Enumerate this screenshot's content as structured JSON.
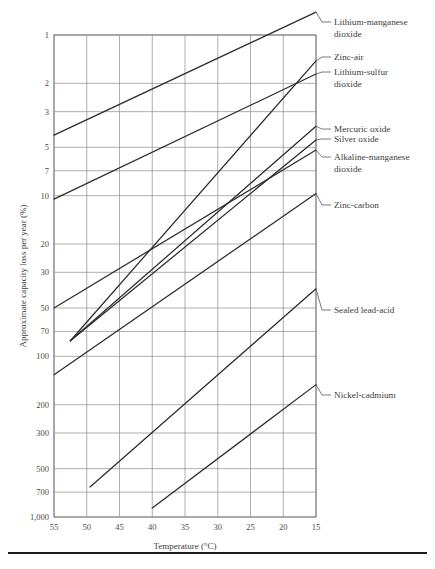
{
  "chart_data": {
    "type": "line",
    "title": "",
    "xlabel": "Temperature (°C)",
    "ylabel": "Approximate capacity loss per year (%)",
    "xticks": [
      55,
      50,
      45,
      40,
      35,
      30,
      25,
      20,
      15
    ],
    "xtick_labels": [
      "55",
      "50",
      "45",
      "40",
      "35",
      "30",
      "25",
      "20",
      "15"
    ],
    "xlim": [
      55,
      15
    ],
    "x_axis_direction": "decreasing",
    "yticks": [
      1,
      2,
      3,
      5,
      7,
      10,
      20,
      30,
      50,
      70,
      100,
      200,
      300,
      500,
      700,
      1000
    ],
    "ytick_labels": [
      "1",
      "2",
      "3",
      "5",
      "7",
      "10",
      "20",
      "30",
      "50",
      "70",
      "100",
      "200",
      "300",
      "500",
      "700",
      "1,000"
    ],
    "ylim": [
      1,
      1000
    ],
    "y_scale": "log",
    "y_axis_direction": "inverted",
    "grid": true,
    "legend_position": "right-inline-labels",
    "series": [
      {
        "name": "Lithium-manganese dioxide",
        "label_lines": [
          "Lithium-manganese",
          "dioxide"
        ],
        "points": [
          [
            55,
            4.2
          ],
          [
            15,
            0.72
          ]
        ]
      },
      {
        "name": "Zinc-air",
        "label_lines": [
          "Zinc-air"
        ],
        "points": [
          [
            52.5,
            80
          ],
          [
            15,
            1.45
          ]
        ]
      },
      {
        "name": "Lithium-sulfur dioxide",
        "label_lines": [
          "Lithium-sulfur",
          "dioxide"
        ],
        "points": [
          [
            55,
            10.5
          ],
          [
            15,
            1.75
          ]
        ]
      },
      {
        "name": "Mercuric oxide",
        "label_lines": [
          "Mercuric oxide"
        ],
        "points": [
          [
            52.5,
            80
          ],
          [
            15,
            3.7
          ]
        ]
      },
      {
        "name": "Silver oxide",
        "label_lines": [
          "Silver oxide"
        ],
        "points": [
          [
            52.5,
            80
          ],
          [
            15,
            4.5
          ]
        ]
      },
      {
        "name": "Alkaline-manganese dioxide",
        "label_lines": [
          "Alkaline-manganese",
          "dioxide"
        ],
        "points": [
          [
            55,
            50
          ],
          [
            15,
            5.2
          ]
        ]
      },
      {
        "name": "Zinc-carbon",
        "label_lines": [
          "Zinc-carbon"
        ],
        "points": [
          [
            55,
            130
          ],
          [
            15,
            9.7
          ]
        ]
      },
      {
        "name": "Sealed lead-acid",
        "label_lines": [
          "Sealed lead-acid"
        ],
        "points": [
          [
            49.5,
            650
          ],
          [
            15,
            38
          ]
        ]
      },
      {
        "name": "Nickel-cadmium",
        "label_lines": [
          "Nickel-cadmium"
        ],
        "points": [
          [
            40,
            880
          ],
          [
            15,
            150
          ]
        ]
      }
    ]
  },
  "figure": {
    "has_bottom_rule": true,
    "background": "#ffffff",
    "line_color": "#2b2b2b",
    "grid_color": "#8d8d8d"
  }
}
